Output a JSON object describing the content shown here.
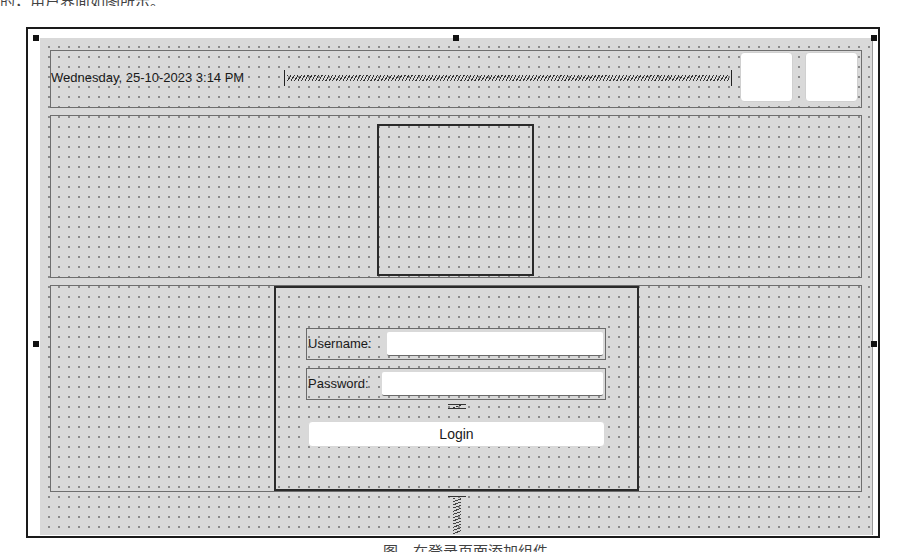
{
  "book": {
    "top_text": "的，用户界面如图所示。",
    "caption": "图　在登录页面添加组件"
  },
  "designer": {
    "top_panel": {
      "datetime_label": "Wednesday, 25-10-2023 3:14 PM",
      "buttons": [
        {
          "name": "icon-button-1",
          "label": ""
        },
        {
          "name": "icon-button-2",
          "label": ""
        }
      ]
    },
    "middle_panel": {
      "logo_frame": ""
    },
    "login_form": {
      "username_label": "Username:",
      "username_value": "",
      "password_label": "Password:",
      "password_value": "",
      "login_button": "Login"
    }
  },
  "colors": {
    "canvas": "#d9d9d9",
    "grid_dot": "#8a8a8a",
    "frame": "#1a1a1a",
    "panel_border": "#6e6e6e",
    "widget_bg": "#ffffff"
  }
}
